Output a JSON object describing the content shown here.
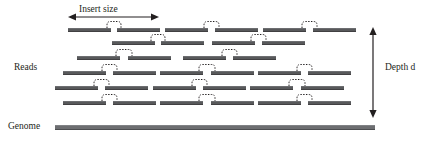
{
  "figure": {
    "type": "diagram",
    "background": "#ffffff",
    "read_color": "#58595b",
    "genome_color": "#6d6e71",
    "line_color": "#231f20",
    "width": 427,
    "height": 141
  },
  "labels": {
    "insert_size": "Insert size",
    "reads": "Reads",
    "genome": "Genome",
    "depth_prefix": "Depth",
    "depth_symbol": "d"
  },
  "insert_size_arrow": {
    "orientation": "horizontal",
    "double_headed": true,
    "x1": 68,
    "x2": 159,
    "y": 17
  },
  "depth_arrow": {
    "orientation": "vertical",
    "double_headed": true,
    "x": 373,
    "y1": 27,
    "y2": 118
  },
  "genome_bar": {
    "x": 55,
    "y": 125,
    "width": 320,
    "height": 5
  },
  "read_rows": [
    {
      "row": 1,
      "y": 28,
      "pairs": [
        {
          "left": {
            "x": 68,
            "w": 43
          },
          "right": {
            "x": 117,
            "w": 43
          }
        },
        {
          "left": {
            "x": 165,
            "w": 43
          },
          "right": {
            "x": 215,
            "w": 43
          }
        },
        {
          "left": {
            "x": 263,
            "w": 43
          },
          "right": {
            "x": 313,
            "w": 43
          }
        }
      ]
    },
    {
      "row": 2,
      "y": 41,
      "pairs": [
        {
          "left": {
            "x": 112,
            "w": 43
          },
          "right": {
            "x": 161,
            "w": 43
          }
        },
        {
          "left": {
            "x": 212,
            "w": 43
          },
          "right": {
            "x": 262,
            "w": 43
          }
        }
      ]
    },
    {
      "row": 3,
      "y": 56,
      "pairs": [
        {
          "left": {
            "x": 77,
            "w": 43
          },
          "right": {
            "x": 128,
            "w": 43
          }
        },
        {
          "left": {
            "x": 183,
            "w": 43
          },
          "right": {
            "x": 233,
            "w": 43
          }
        }
      ]
    },
    {
      "row": 4,
      "y": 71,
      "pairs": [
        {
          "left": {
            "x": 63,
            "w": 43
          },
          "right": {
            "x": 113,
            "w": 43
          }
        },
        {
          "left": {
            "x": 160,
            "w": 43
          },
          "right": {
            "x": 211,
            "w": 43
          }
        },
        {
          "left": {
            "x": 258,
            "w": 43
          },
          "right": {
            "x": 308,
            "w": 43
          }
        }
      ]
    },
    {
      "row": 5,
      "y": 86,
      "pairs": [
        {
          "left": {
            "x": 55,
            "w": 43
          },
          "right": {
            "x": 105,
            "w": 43
          }
        },
        {
          "left": {
            "x": 153,
            "w": 43
          },
          "right": {
            "x": 203,
            "w": 43
          }
        },
        {
          "left": {
            "x": 250,
            "w": 43
          },
          "right": {
            "x": 301,
            "w": 43
          }
        }
      ]
    },
    {
      "row": 6,
      "y": 101,
      "pairs": [
        {
          "left": {
            "x": 63,
            "w": 43
          },
          "right": {
            "x": 113,
            "w": 43
          }
        },
        {
          "left": {
            "x": 160,
            "w": 43
          },
          "right": {
            "x": 211,
            "w": 43
          }
        },
        {
          "left": {
            "x": 258,
            "w": 43
          },
          "right": {
            "x": 308,
            "w": 43
          }
        }
      ]
    }
  ],
  "label_positions": {
    "insert_size": {
      "x": 79,
      "y": 5
    },
    "reads": {
      "x": 14,
      "y": 63
    },
    "genome": {
      "x": 8,
      "y": 122
    },
    "depth": {
      "x": 385,
      "y": 63
    }
  }
}
